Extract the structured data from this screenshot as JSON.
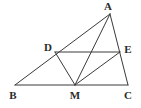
{
  "figure": {
    "background_color": "#ffffff",
    "stroke_color": "#3a3a3a",
    "label_color": "#2b2b2b",
    "width": 141,
    "height": 108,
    "points": [
      {
        "id": "A",
        "label": "A",
        "x": 110,
        "y": 14,
        "label_x": 108,
        "label_y": 6,
        "on": "apex"
      },
      {
        "id": "B",
        "label": "B",
        "x": 15,
        "y": 85,
        "label_x": 13,
        "label_y": 95,
        "on": "baseline-left"
      },
      {
        "id": "C",
        "label": "C",
        "x": 128,
        "y": 85,
        "label_x": 128,
        "label_y": 95,
        "on": "baseline-right"
      },
      {
        "id": "M",
        "label": "M",
        "x": 75,
        "y": 85,
        "label_x": 75,
        "label_y": 95,
        "on": "segment-BC"
      },
      {
        "id": "D",
        "label": "D",
        "x": 55,
        "y": 52,
        "label_x": 48,
        "label_y": 47,
        "on": "segment-AB"
      },
      {
        "id": "E",
        "label": "E",
        "x": 120,
        "y": 52,
        "label_x": 128,
        "label_y": 49,
        "on": "segment-AC"
      }
    ],
    "segments": [
      {
        "id": "BC",
        "from": "B",
        "to": "C",
        "x1": 15,
        "y1": 85,
        "x2": 128,
        "y2": 85
      },
      {
        "id": "BA",
        "from": "B",
        "to": "A",
        "x1": 15,
        "y1": 85,
        "x2": 110,
        "y2": 14
      },
      {
        "id": "AC",
        "from": "A",
        "to": "C",
        "x1": 110,
        "y1": 14,
        "x2": 128,
        "y2": 85
      },
      {
        "id": "DE",
        "from": "D",
        "to": "E",
        "x1": 55,
        "y1": 52,
        "x2": 120,
        "y2": 52
      },
      {
        "id": "DM",
        "from": "D",
        "to": "M",
        "x1": 55,
        "y1": 52,
        "x2": 75,
        "y2": 85
      },
      {
        "id": "AM",
        "from": "A",
        "to": "M",
        "x1": 110,
        "y1": 14,
        "x2": 75,
        "y2": 85
      },
      {
        "id": "ME",
        "from": "M",
        "to": "E",
        "x1": 75,
        "y1": 85,
        "x2": 120,
        "y2": 52
      }
    ],
    "stroke_width": 1
  }
}
